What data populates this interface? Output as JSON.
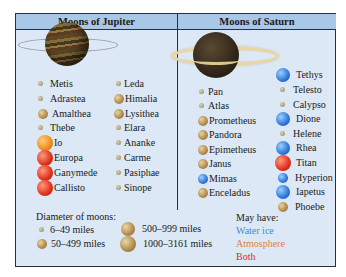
{
  "jupiter": {
    "title": "Moons of Jupiter",
    "left_column": [
      {
        "name": "Metis",
        "size": "6-49",
        "color": "none"
      },
      {
        "name": "Adrastea",
        "size": "6-49",
        "color": "none"
      },
      {
        "name": "Amalthea",
        "size": "50-499",
        "color": "none"
      },
      {
        "name": "Thebe",
        "size": "6-49",
        "color": "none"
      },
      {
        "name": "Io",
        "size": "1000-3161",
        "color": "atmosphere"
      },
      {
        "name": "Europa",
        "size": "1000-3161",
        "color": "both"
      },
      {
        "name": "Ganymede",
        "size": "1000-3161",
        "color": "both"
      },
      {
        "name": "Callisto",
        "size": "1000-3161",
        "color": "both"
      }
    ],
    "right_column": [
      {
        "name": "Leda",
        "size": "6-49",
        "color": "none"
      },
      {
        "name": "Himalia",
        "size": "50-499",
        "color": "none"
      },
      {
        "name": "Lysithea",
        "size": "50-499",
        "color": "none"
      },
      {
        "name": "Elara",
        "size": "6-49",
        "color": "none"
      },
      {
        "name": "Ananke",
        "size": "6-49",
        "color": "none"
      },
      {
        "name": "Carme",
        "size": "6-49",
        "color": "none"
      },
      {
        "name": "Pasiphae",
        "size": "6-49",
        "color": "none"
      },
      {
        "name": "Sinope",
        "size": "6-49",
        "color": "none"
      }
    ]
  },
  "saturn": {
    "title": "Moons of Saturn",
    "left_column": [
      {
        "name": "Pan",
        "size": "6-49",
        "color": "none"
      },
      {
        "name": "Atlas",
        "size": "6-49",
        "color": "none"
      },
      {
        "name": "Prometheus",
        "size": "50-499",
        "color": "none"
      },
      {
        "name": "Pandora",
        "size": "50-499",
        "color": "none"
      },
      {
        "name": "Epimetheus",
        "size": "50-499",
        "color": "none"
      },
      {
        "name": "Janus",
        "size": "50-499",
        "color": "none"
      },
      {
        "name": "Mimas",
        "size": "50-499",
        "color": "water_ice"
      },
      {
        "name": "Enceladus",
        "size": "50-499",
        "color": "none"
      }
    ],
    "right_column": [
      {
        "name": "Tethys",
        "size": "500-999",
        "color": "water_ice"
      },
      {
        "name": "Telesto",
        "size": "6-49",
        "color": "none"
      },
      {
        "name": "Calypso",
        "size": "6-49",
        "color": "none"
      },
      {
        "name": "Dione",
        "size": "500-999",
        "color": "water_ice"
      },
      {
        "name": "Helene",
        "size": "6-49",
        "color": "none"
      },
      {
        "name": "Rhea",
        "size": "500-999",
        "color": "water_ice"
      },
      {
        "name": "Titan",
        "size": "1000-3161",
        "color": "both"
      },
      {
        "name": "Hyperion",
        "size": "50-499",
        "color": "water_ice"
      },
      {
        "name": "Iapetus",
        "size": "500-999",
        "color": "water_ice"
      },
      {
        "name": "Phoebe",
        "size": "50-499",
        "color": "none"
      }
    ]
  },
  "legend": {
    "diameter_title": "Diameter of moons:",
    "sizes": [
      "6–49 miles",
      "50–499 miles",
      "500–999 miles",
      "1000–3161 miles"
    ],
    "may_have_title": "May have:",
    "water_ice": "Water ice",
    "atmosphere": "Atmosphere",
    "both": "Both"
  },
  "colors": {
    "water_ice": "#3a8fd8",
    "atmosphere": "#e0823a",
    "both": "#d42b2b",
    "header_bg": "#a9c8e8",
    "panel_bg": "#dce8f5"
  }
}
